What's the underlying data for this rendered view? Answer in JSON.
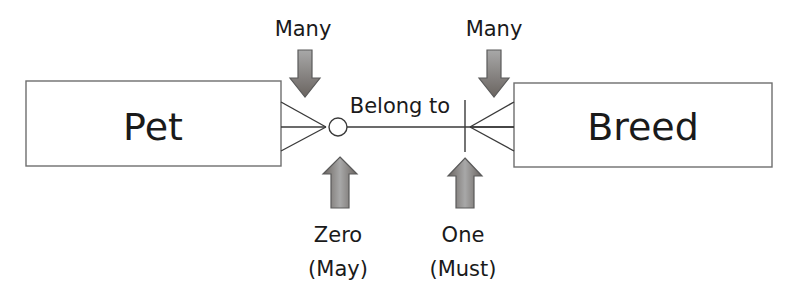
{
  "entities": [
    {
      "name": "Pet"
    },
    {
      "name": "Breed"
    }
  ],
  "relationship": {
    "label": "Belong to"
  },
  "annotations": {
    "pet_side_many": "Many",
    "breed_side_many": "Many",
    "zero_title": "Zero",
    "zero_sub": "(May)",
    "one_title": "One",
    "one_sub": "(Must)"
  },
  "colors": {
    "arrow_fill_top": "#9a9a9a",
    "arrow_fill_bottom": "#6f6a66",
    "line": "#3a3a3a",
    "box_stroke": "#6e6e6e"
  }
}
